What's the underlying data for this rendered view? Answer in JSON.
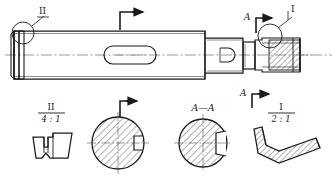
{
  "drawing": {
    "type": "engineering-part-drawing",
    "description": "Stepped shaft with keyway slots, threaded end, detail and section views",
    "line_color": "#1a1a1a",
    "centerline_color": "#555555",
    "hatch_color": "#1a1a1a",
    "background": "#ffffff"
  },
  "main_view": {
    "name": "stepped-shaft-elevation",
    "callouts": {
      "detail_two_leader": "II",
      "detail_one_leader": "I",
      "section_a_top": "A",
      "section_a_bottom": "A"
    },
    "features": {
      "left_groove": "retaining-groove",
      "long_slot": "long-keyway-slot",
      "short_slot": "short-keyway-slot",
      "threaded_end": "threaded-section"
    }
  },
  "views": [
    {
      "id": "detail-ii",
      "label": "II",
      "scale": "4 : 1",
      "kind": "detail",
      "shape": "groove-profile"
    },
    {
      "id": "section-b",
      "label": "",
      "scale": "",
      "kind": "section",
      "shape": "round-with-keyway"
    },
    {
      "id": "section-aa",
      "label": "A—A",
      "scale": "",
      "kind": "section",
      "shape": "round-with-deep-keyway"
    },
    {
      "id": "detail-i",
      "label": "I",
      "scale": "2 : 1",
      "kind": "detail",
      "shape": "undercut-profile"
    }
  ],
  "arrows": {
    "view_arrow_top_left": "section-arrow-right",
    "view_arrow_top_right": "section-arrow-right",
    "view_arrow_bottom_left": "section-arrow-right",
    "view_arrow_bottom_right": "section-arrow-right"
  }
}
